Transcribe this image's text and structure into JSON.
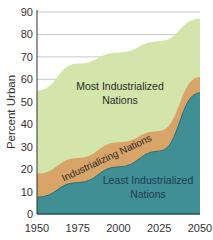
{
  "chart_data": {
    "type": "area",
    "title": "",
    "xlabel": "",
    "ylabel": "Percent Urban",
    "x": [
      1950,
      1975,
      2000,
      2025,
      2050
    ],
    "xticks": [
      "1950",
      "1975",
      "2000",
      "2025",
      "2050"
    ],
    "yticks": [
      "0",
      "10",
      "20",
      "30",
      "40",
      "50",
      "60",
      "70",
      "80",
      "90"
    ],
    "ylim": [
      0,
      90
    ],
    "grid": true,
    "legend": "inline labels",
    "series": [
      {
        "name": "Most Industrialized Nations",
        "label_lines": [
          "Most Industrialized",
          "Nations"
        ],
        "values": [
          55,
          67,
          72,
          77,
          87
        ],
        "color": "#d4e5ab"
      },
      {
        "name": "Industrializing Nations",
        "label_lines": [
          "Industrializing Nations"
        ],
        "values": [
          18,
          25,
          32,
          37,
          61
        ],
        "color": "#d9a467"
      },
      {
        "name": "Least Industrialized Nations",
        "label_lines": [
          "Least Industrialized",
          "Nations"
        ],
        "values": [
          7.5,
          14,
          21,
          28,
          54
        ],
        "color": "#3f8f95"
      }
    ]
  },
  "colors": {
    "grid": "#c8c8c8",
    "axis": "#333333",
    "teal_edge": "#2f6f78"
  }
}
